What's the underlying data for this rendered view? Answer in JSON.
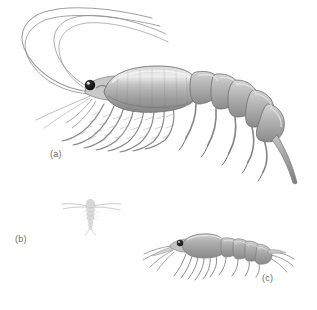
{
  "figure": {
    "background_color": "#ffffff",
    "width": 317,
    "height": 310,
    "kind": "scientific-illustration-plate"
  },
  "labels": {
    "a": "(a)",
    "b": "(b)",
    "c": "(c)"
  },
  "palette": {
    "background": "#ffffff",
    "label_text": "#6b6b6b",
    "outline_dark": "#5d5d5d",
    "outline_mid": "#8d8d8d",
    "body_light": "#d2d2d2",
    "body_mid": "#b0b0b0",
    "body_dark": "#8c8c8c",
    "shadow": "#7a7a7a",
    "eye_black": "#111111",
    "eye_highlight": "#f2f2f2",
    "antenna_line": "#8a8a8a",
    "faint_specimen": "#cdcdcd"
  },
  "specimens": [
    {
      "id": "a",
      "label": "(a)",
      "name": "large-shrimp-like-crustacean",
      "position": "upper-body of plate, facing left",
      "features": [
        "two pairs of very long curving antennae sweeping up and left",
        "glossy black stalked eye",
        "large oval stippled carapace shield",
        "row of feathery thoracic legs beneath carapace",
        "segmented abdomen with pleopods curving to lower right",
        "tapering pointed telson"
      ]
    },
    {
      "id": "b",
      "label": "(b)",
      "name": "small-copepod-dorsal-view",
      "position": "lower-left of plate, dorsal view",
      "features": [
        "very small pale body",
        "wide straight lateral first antennae",
        "narrow segmented urosome",
        "forked caudal rami"
      ]
    },
    {
      "id": "c",
      "label": "(c)",
      "name": "medium-mysid-shrimp",
      "position": "lower-right of plate, facing left",
      "features": [
        "dark eye at head",
        "antennae sweeping left",
        "smooth carapace",
        "row of thoracic legs hanging below",
        "segmented abdomen with uropods to the right"
      ]
    }
  ]
}
